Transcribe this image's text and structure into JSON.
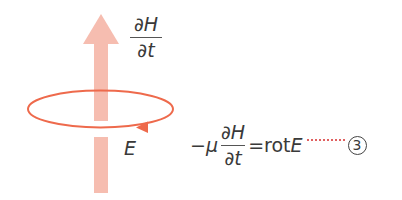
{
  "colors": {
    "arrow": "#f6bdb0",
    "loop": "#ee6a4c",
    "text": "#3a3a3a",
    "leader": "#e06060"
  },
  "arrow_label": {
    "numerator": "∂H",
    "denominator": "∂t"
  },
  "loop_label": "E",
  "equation": {
    "sign": "−",
    "mu": "μ",
    "numerator": "∂H",
    "denominator": "∂t",
    "equals": "=",
    "rot": "rot",
    "E": "E",
    "number": "3"
  }
}
